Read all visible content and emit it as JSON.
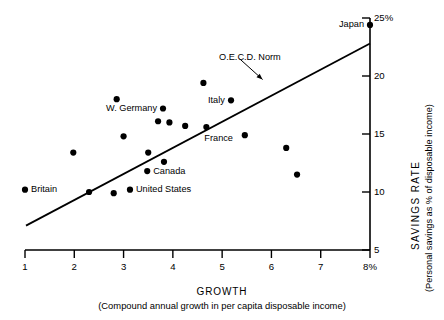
{
  "chart_data": {
    "type": "scatter",
    "title": "",
    "xlabel": "GROWTH",
    "xlabel_sub": "(Compound annual growth in per capita disposable income)",
    "ylabel": "SAVINGS RATE",
    "ylabel_sub": "(Personal savings as % of disposable income)",
    "xlim": [
      1,
      8
    ],
    "ylim": [
      5,
      25
    ],
    "xticks": [
      "1",
      "2",
      "3",
      "4",
      "5",
      "6",
      "7",
      "8%"
    ],
    "xtick_values": [
      1,
      2,
      3,
      4,
      5,
      6,
      7,
      8
    ],
    "yticks": [
      "25%",
      "20",
      "15",
      "10",
      "5"
    ],
    "ytick_values": [
      25,
      20,
      15,
      10,
      5
    ],
    "grid": false,
    "legend": "none",
    "axis_position": {
      "x": "bottom",
      "y": "right"
    },
    "points": [
      {
        "label": "Britain",
        "x": 1.0,
        "y": 10.2,
        "label_pos": "right"
      },
      {
        "label": "",
        "x": 1.98,
        "y": 13.4,
        "label_pos": "none"
      },
      {
        "label": "",
        "x": 2.3,
        "y": 10.0,
        "label_pos": "none"
      },
      {
        "label": "",
        "x": 2.8,
        "y": 9.9,
        "label_pos": "none"
      },
      {
        "label": "",
        "x": 2.86,
        "y": 18.0,
        "label_pos": "none"
      },
      {
        "label": "",
        "x": 3.0,
        "y": 14.8,
        "label_pos": "none"
      },
      {
        "label": "United States",
        "x": 3.13,
        "y": 10.2,
        "label_pos": "right"
      },
      {
        "label": "Canada",
        "x": 3.48,
        "y": 11.8,
        "label_pos": "right"
      },
      {
        "label": "",
        "x": 3.5,
        "y": 13.4,
        "label_pos": "none"
      },
      {
        "label": "",
        "x": 3.7,
        "y": 16.1,
        "label_pos": "none"
      },
      {
        "label": "W. Germany",
        "x": 3.8,
        "y": 17.2,
        "label_pos": "left"
      },
      {
        "label": "",
        "x": 3.82,
        "y": 12.6,
        "label_pos": "none"
      },
      {
        "label": "",
        "x": 3.93,
        "y": 16.0,
        "label_pos": "none"
      },
      {
        "label": "",
        "x": 4.25,
        "y": 15.7,
        "label_pos": "none"
      },
      {
        "label": "",
        "x": 4.62,
        "y": 19.4,
        "label_pos": "none"
      },
      {
        "label": "France",
        "x": 4.68,
        "y": 15.6,
        "label_pos": "below-right"
      },
      {
        "label": "Italy",
        "x": 5.18,
        "y": 17.9,
        "label_pos": "left"
      },
      {
        "label": "",
        "x": 5.46,
        "y": 14.9,
        "label_pos": "none"
      },
      {
        "label": "",
        "x": 6.3,
        "y": 13.8,
        "label_pos": "none"
      },
      {
        "label": "",
        "x": 6.52,
        "y": 11.5,
        "label_pos": "none"
      },
      {
        "label": "Japan",
        "x": 8.0,
        "y": 24.4,
        "label_pos": "left"
      }
    ],
    "trendline": {
      "label": "O.E.C.D. Norm",
      "x0": 1.02,
      "y0": 7.1,
      "x1": 8.0,
      "y1": 22.8
    },
    "annotation": {
      "text": "O.E.C.D. Norm",
      "leader_from": {
        "x": 5.35,
        "y": 21.5
      },
      "leader_to": {
        "x": 5.82,
        "y": 19.7
      }
    }
  }
}
